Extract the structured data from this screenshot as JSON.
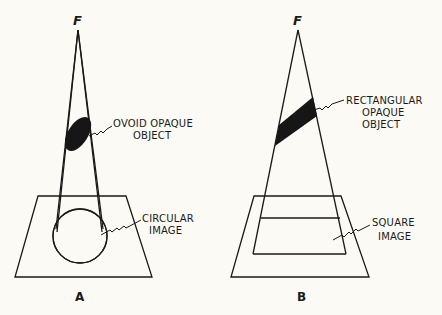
{
  "panels": [
    {
      "id": "A",
      "panel_label": "A",
      "focal_label": "F",
      "object_label_line1": "OVOID OPAQUE",
      "object_label_line2": "OBJECT",
      "image_label_line1": "CIRCULAR",
      "image_label_line2": "IMAGE"
    },
    {
      "id": "B",
      "panel_label": "B",
      "focal_label": "F",
      "object_label_line1": "RECTANGULAR",
      "object_label_line2": "OPAQUE",
      "object_label_line3": "OBJECT",
      "image_label_line1": "SQUARE",
      "image_label_line2": "IMAGE"
    }
  ],
  "colors": {
    "background": "#fbfaf5",
    "ink": "#1a1a1a"
  }
}
